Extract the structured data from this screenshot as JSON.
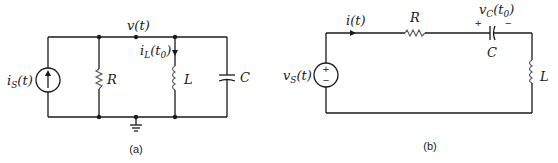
{
  "figure_a": {
    "caption": "(a)",
    "node_label": "v(t)",
    "source_label": "i",
    "source_sub": "S",
    "source_arg": "(t)",
    "resistor_label": "R",
    "inductor_current_label": "i",
    "inductor_current_sub": "L",
    "inductor_current_arg_open": "(t",
    "inductor_current_arg_sub": "0",
    "inductor_current_arg_close": ")",
    "inductor_label": "L",
    "capacitor_label": "C"
  },
  "figure_b": {
    "caption": "(b)",
    "current_label": "i(t)",
    "resistor_label": "R",
    "capacitor_voltage_label": "v",
    "capacitor_voltage_sub": "C",
    "capacitor_voltage_arg_open": "(t",
    "capacitor_voltage_arg_sub": "0",
    "capacitor_voltage_arg_close": ")",
    "plus_sign": "+",
    "minus_sign": "−",
    "capacitor_label": "C",
    "inductor_label": "L",
    "source_label": "v",
    "source_sub": "S",
    "source_arg": "(t)",
    "source_plus": "+",
    "source_minus": "−"
  }
}
